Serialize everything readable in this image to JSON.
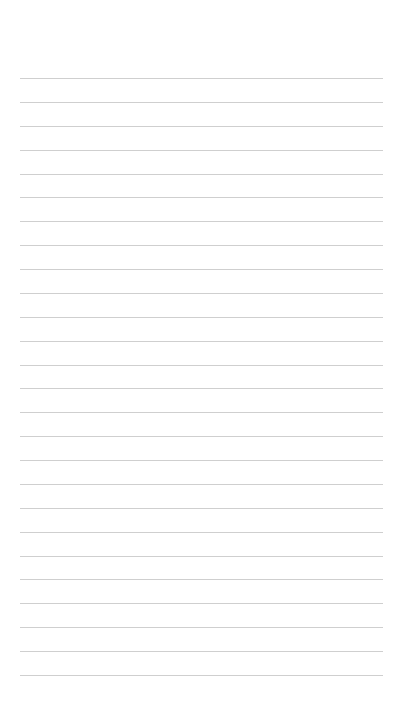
{
  "page": {
    "type": "lined-paper",
    "background": "#ffffff",
    "line_color": "#cfcfcf",
    "line_count": 26,
    "first_line_y": 78,
    "line_spacing": 23.88,
    "line_left": 20,
    "line_right": 383
  }
}
